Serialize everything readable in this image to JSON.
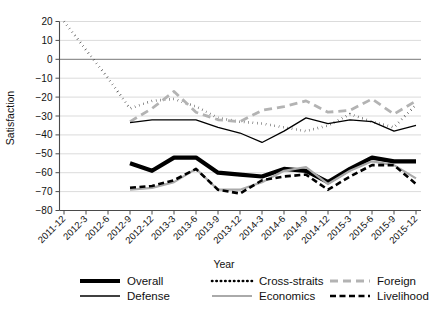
{
  "chart_data": {
    "type": "line",
    "title": "",
    "xlabel": "Year",
    "ylabel": "Satisfaction",
    "ylim": [
      -80,
      20
    ],
    "yticks": [
      20,
      10,
      0,
      -10,
      -20,
      -30,
      -40,
      -50,
      -60,
      -70,
      -80
    ],
    "ytick_labels": [
      "20",
      "10",
      "0",
      "−10",
      "−20",
      "−30",
      "−40",
      "−50",
      "−60",
      "−70",
      "−80"
    ],
    "grid": true,
    "legend_position": "bottom",
    "categories": [
      "2011-12",
      "2012-3",
      "2012-6",
      "2012-9",
      "2012-12",
      "2013-3",
      "2013-6",
      "2013-9",
      "2013-12",
      "2014-3",
      "2014-6",
      "2014-9",
      "2014-12",
      "2015-3",
      "2015-6",
      "2015-9",
      "2015-12"
    ],
    "series": [
      {
        "name": "Overall",
        "style": "thick-solid",
        "color": "#000000",
        "values": [
          3,
          null,
          null,
          -55,
          -59,
          -52,
          -52,
          -60,
          -61,
          -62,
          -58,
          -59,
          -65,
          -58,
          -52,
          -54,
          -54
        ]
      },
      {
        "name": "Cross-straits",
        "style": "dotted",
        "color": "#000000",
        "values": [
          20,
          5,
          -10,
          -26,
          -22,
          -21,
          -25,
          -31,
          -33,
          -34,
          -36,
          -38,
          -35,
          -29,
          -33,
          -36,
          -24
        ]
      },
      {
        "name": "Foreign",
        "style": "gray-dashed",
        "color": "#b3b3b3",
        "values": [
          null,
          null,
          null,
          -33,
          -26,
          -17,
          -28,
          -32,
          -33,
          -27,
          -25,
          -22,
          -28,
          -27,
          -21,
          -29,
          -22
        ]
      },
      {
        "name": "Defense",
        "style": "thin-solid",
        "color": "#000000",
        "values": [
          null,
          null,
          null,
          -33.5,
          -32,
          -32,
          -32,
          -36,
          -39,
          -44,
          -38,
          -31,
          -34,
          -32,
          -33,
          -38,
          -35
        ]
      },
      {
        "name": "Economics",
        "style": "gray-solid",
        "color": "#aaaaaa",
        "values": [
          null,
          null,
          null,
          -69,
          -68,
          -65,
          -58,
          -69,
          -69,
          -65,
          -59,
          -57,
          -66,
          -59,
          -54,
          -56,
          -63
        ]
      },
      {
        "name": "Livelihood",
        "style": "black-dashed",
        "color": "#000000",
        "values": [
          null,
          null,
          null,
          -68,
          -67,
          -64,
          -58,
          -69,
          -71,
          -64,
          -62,
          -61,
          -69,
          -62,
          -56,
          -56,
          -66
        ]
      }
    ]
  },
  "legend": {
    "items": [
      {
        "label": "Overall",
        "key": "overall"
      },
      {
        "label": "Cross-straits",
        "key": "cross-straits"
      },
      {
        "label": "Foreign",
        "key": "foreign"
      },
      {
        "label": "Defense",
        "key": "defense"
      },
      {
        "label": "Economics",
        "key": "economics"
      },
      {
        "label": "Livelihood",
        "key": "livelihood"
      }
    ]
  }
}
